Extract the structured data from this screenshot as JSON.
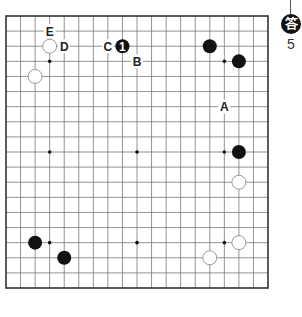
{
  "diagram": {
    "type": "go-board",
    "board_size": 19,
    "colors": {
      "line": "#777777",
      "border": "#333333",
      "black_stone": "#111111",
      "white_stone_fill": "#ffffff",
      "white_stone_stroke": "#999999",
      "label": "#222222"
    },
    "stones": [
      {
        "color": "white",
        "col": 3,
        "row": 2
      },
      {
        "color": "white",
        "col": 2,
        "row": 4
      },
      {
        "color": "black",
        "col": 8,
        "row": 2,
        "number": "1"
      },
      {
        "color": "black",
        "col": 14,
        "row": 2
      },
      {
        "color": "black",
        "col": 16,
        "row": 3
      },
      {
        "color": "black",
        "col": 16,
        "row": 9
      },
      {
        "color": "white",
        "col": 16,
        "row": 11
      },
      {
        "color": "black",
        "col": 2,
        "row": 15
      },
      {
        "color": "black",
        "col": 4,
        "row": 16
      },
      {
        "color": "white",
        "col": 16,
        "row": 15
      },
      {
        "color": "white",
        "col": 14,
        "row": 16
      }
    ],
    "labels": [
      {
        "text": "E",
        "col": 3,
        "row": 1
      },
      {
        "text": "D",
        "col": 4,
        "row": 2
      },
      {
        "text": "C",
        "col": 7,
        "row": 2
      },
      {
        "text": "B",
        "col": 9,
        "row": 3
      },
      {
        "text": "A",
        "col": 15,
        "row": 6
      }
    ],
    "star_points": [
      {
        "col": 3,
        "row": 3
      },
      {
        "col": 9,
        "row": 3
      },
      {
        "col": 15,
        "row": 3
      },
      {
        "col": 3,
        "row": 9
      },
      {
        "col": 9,
        "row": 9
      },
      {
        "col": 15,
        "row": 9
      },
      {
        "col": 3,
        "row": 15
      },
      {
        "col": 9,
        "row": 15
      },
      {
        "col": 15,
        "row": 15
      }
    ]
  },
  "badge": {
    "glyph": "答",
    "number": "5"
  }
}
